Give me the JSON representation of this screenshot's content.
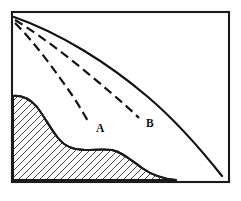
{
  "figure": {
    "kind": "cross-section-diagram",
    "background_color": "#ffffff",
    "line_color": "#121212",
    "frame": {
      "x": 12,
      "y": 12,
      "width": 217,
      "height": 170,
      "stroke_width": 2.1
    },
    "origin_point": {
      "x": 14,
      "y": 17
    },
    "labels": [
      {
        "id": "A",
        "text": "A",
        "x": 96,
        "y": 132
      },
      {
        "id": "B",
        "text": "B",
        "x": 146,
        "y": 127
      }
    ],
    "curves": [
      {
        "name": "upper-solid-boundary",
        "style": "solid",
        "path": "M 14,17 C 60,33 108,63 148,97 C 175,120 203,152 222,176"
      },
      {
        "name": "dashed-curve-to-B",
        "style": "dashed",
        "dash_pattern": "9 5",
        "path": "M 15,20 C 48,40 82,68 110,92 C 123,103 132,111 139,118"
      },
      {
        "name": "dashed-curve-to-A",
        "style": "dashed",
        "dash_pattern": "9 5",
        "path": "M 15,23 C 36,44 56,72 72,95 C 80,107 85,116 89,123"
      }
    ],
    "hatched_region": {
      "name": "substrate",
      "hatch_angle_deg": 45,
      "hatch_spacing_px": 7,
      "hatch_color": "#2b2b2b",
      "boundary_path": "M 13,96 C 22,95 30,99 37,107 C 44,116 50,128 58,138 C 65,147 74,150 85,150 C 95,150 104,149 112,150 C 122,152 131,160 142,168 C 152,175 163,179 176,180 L 13,180 Z"
    }
  }
}
